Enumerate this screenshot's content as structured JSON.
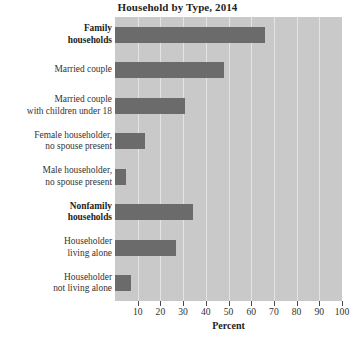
{
  "chart_data": {
    "type": "bar",
    "orientation": "horizontal",
    "title": "Household by Type, 2014",
    "xlabel": "Percent",
    "ylabel": "",
    "xlim": [
      0,
      100
    ],
    "grid": true,
    "legend": null,
    "categories": [
      "Family households",
      "Married couple",
      "Married couple with children under 18",
      "Female householder, no spouse present",
      "Male householder, no spouse present",
      "Nonfamily households",
      "Householder living alone",
      "Householder not living alone"
    ],
    "values": [
      66,
      48,
      31,
      13,
      5,
      34.5,
      27,
      7
    ],
    "xticks": [
      10,
      20,
      30,
      40,
      50,
      60,
      70,
      80,
      90,
      100
    ],
    "bar_color": "#6b6b6b",
    "plot_background": "#c9c9c9",
    "gridline_color": "#e4e4e4"
  },
  "categories_display": [
    {
      "lines": [
        "Family",
        "households"
      ],
      "bold": true
    },
    {
      "lines": [
        "Married couple"
      ],
      "bold": false
    },
    {
      "lines": [
        "Married couple",
        "with children under 18"
      ],
      "bold": false
    },
    {
      "lines": [
        "Female householder,",
        "no spouse present"
      ],
      "bold": false
    },
    {
      "lines": [
        "Male householder,",
        "no spouse present"
      ],
      "bold": false
    },
    {
      "lines": [
        "Nonfamily",
        "households"
      ],
      "bold": true
    },
    {
      "lines": [
        "Householder",
        "living alone"
      ],
      "bold": false
    },
    {
      "lines": [
        "Householder",
        "not living alone"
      ],
      "bold": false
    }
  ]
}
